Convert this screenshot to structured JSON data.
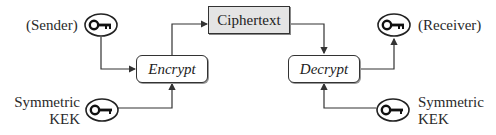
{
  "diagram": {
    "type": "symmetric key wrapping flow",
    "nodes": {
      "sender_key": {
        "label": "(Sender)",
        "icon": "key-icon"
      },
      "encrypt": {
        "label": "Encrypt"
      },
      "ciphertext": {
        "label": "Ciphertext"
      },
      "decrypt": {
        "label": "Decrypt"
      },
      "receiver_key": {
        "label": "(Receiver)",
        "icon": "key-icon"
      },
      "kek_left": {
        "label_line1": "Symmetric",
        "label_line2": "KEK",
        "icon": "key-icon"
      },
      "kek_right": {
        "label_line1": "Symmetric",
        "label_line2": "KEK",
        "icon": "key-icon"
      }
    },
    "edges": [
      {
        "from": "sender_key",
        "to": "encrypt"
      },
      {
        "from": "kek_left",
        "to": "encrypt"
      },
      {
        "from": "encrypt",
        "to": "ciphertext"
      },
      {
        "from": "ciphertext",
        "to": "decrypt"
      },
      {
        "from": "kek_right",
        "to": "decrypt"
      },
      {
        "from": "decrypt",
        "to": "receiver_key"
      }
    ],
    "colors": {
      "line": "#333333",
      "ciphertext_fill": "#e4e4e4",
      "box_fill": "#ffffff"
    }
  }
}
